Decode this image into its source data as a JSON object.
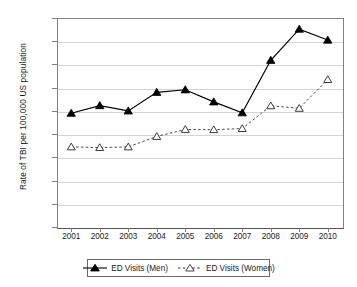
{
  "chart_data": {
    "type": "line",
    "title": "",
    "subtitle": "",
    "xlabel": "",
    "ylabel": "Rate of TBI per 100,000 US population",
    "categories": [
      "2001",
      "2002",
      "2003",
      "2004",
      "2005",
      "2006",
      "2007",
      "2008",
      "2009",
      "2010"
    ],
    "x": [
      2001,
      2002,
      2003,
      2004,
      2005,
      2006,
      2007,
      2008,
      2009,
      2010
    ],
    "series": [
      {
        "name": "ED Visits (Men)",
        "values": [
          490,
          523,
          500,
          580,
          591,
          539,
          492,
          718,
          852,
          805
        ],
        "marker": "filled-triangle",
        "line_style": "solid",
        "color": "#000000"
      },
      {
        "name": "ED Visits (Women)",
        "values": [
          345,
          342,
          345,
          390,
          420,
          419,
          424,
          522,
          511,
          635
        ],
        "marker": "open-triangle",
        "line_style": "dashed",
        "color": "#4d4d4d"
      }
    ],
    "ylim": [
      0,
      900
    ],
    "ytick_values": [
      0,
      100,
      200,
      300,
      400,
      500,
      600,
      700,
      800,
      900
    ],
    "ytick_labels": [
      "0",
      "100",
      "200",
      "300",
      "400",
      "500",
      "600",
      "700",
      "800",
      "900"
    ],
    "xtick_labels": [
      "2001",
      "2002",
      "2003",
      "2004",
      "2005",
      "2006",
      "2007",
      "2008",
      "2009",
      "2010"
    ],
    "grid": "horizontal",
    "grid_color": "#d4d4d4",
    "legend_position": "bottom",
    "legend_entries": [
      "ED Visits (Men)",
      "ED Visits (Women)"
    ],
    "annotations": [],
    "plot_background": "#ffffff",
    "axis_color": "#808080"
  }
}
